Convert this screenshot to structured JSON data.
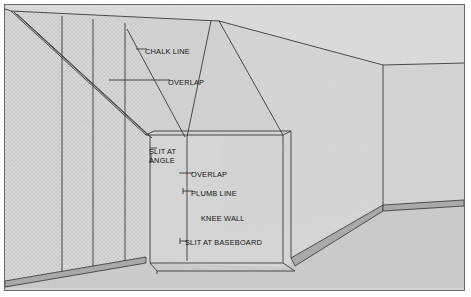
{
  "figure": {
    "type": "technical-line-diagram",
    "colors": {
      "page_background": "#ffffff",
      "frame_border": "#6a6a6a",
      "wall_fill": "#d6d6d6",
      "slope_ceiling_fill": "#d2d2d2",
      "textured_wall_fill": "#d9d9d9",
      "floor_fill": "#cdcdcd",
      "baseboard_fill": "#a9a9a9",
      "line_color": "#3a3a3a",
      "text_color": "#121212"
    }
  },
  "labels": [
    {
      "id": "chalk-line",
      "text": "CHALK LINE",
      "x": 144,
      "y": 47
    },
    {
      "id": "overlap-upper",
      "text": "OVERLAP",
      "x": 167,
      "y": 78
    },
    {
      "id": "slit-at-angle-1",
      "text": "SLIT AT",
      "x": 148,
      "y": 147
    },
    {
      "id": "slit-at-angle-2",
      "text": "ANGLE",
      "x": 148,
      "y": 156
    },
    {
      "id": "overlap-lower",
      "text": "OVERLAP",
      "x": 190,
      "y": 170
    },
    {
      "id": "plumb-line",
      "text": "PLUMB LINE",
      "x": 190,
      "y": 189
    },
    {
      "id": "knee-wall",
      "text": "KNEE WALL",
      "x": 200,
      "y": 214
    },
    {
      "id": "slit-at-baseboard",
      "text": "SLIT AT BASEBOARD",
      "x": 184,
      "y": 238
    }
  ],
  "geometry": {
    "ceiling_ridge_points": "10,10 218,20 382,64",
    "left_wall_seams_x": [
      57,
      88,
      120
    ],
    "slope_seam_lines": [
      {
        "x1": 122,
        "y1": 28,
        "x2": 180,
        "y2": 134
      },
      {
        "x1": 206,
        "y1": 23,
        "x2": 182,
        "y2": 134
      }
    ],
    "knee_wall_top_y": 134,
    "knee_wall_left_x": 145,
    "knee_wall_right_x": 278,
    "knee_wall_base_y": 258,
    "right_corner_x": 382,
    "right_corner_baseboard_y": 206
  }
}
